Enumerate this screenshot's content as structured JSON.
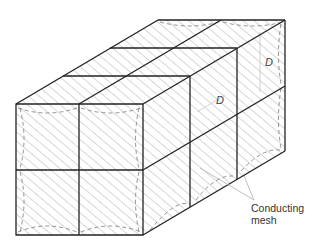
{
  "diagram": {
    "type": "oblique cuboid divided into 2x2x3 cells with hatched faces",
    "labels": {
      "dimension_top": "D",
      "dimension_side": "D",
      "callout": [
        "Conducting",
        "mesh"
      ]
    },
    "colors": {
      "edge": "#222222",
      "hatch": "#9a9a9a",
      "dashed": "#777777",
      "leader": "#b0b0b0"
    }
  }
}
